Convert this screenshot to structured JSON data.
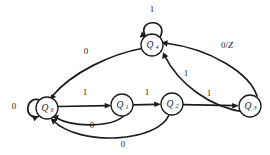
{
  "diagram": {
    "type": "state-transition-diagram",
    "title": "",
    "colors": {
      "stroke": "#1c1c1c",
      "fill": "#ffffff",
      "background": "#ffffff"
    },
    "states": [
      {
        "id": "Q0",
        "label": "Q",
        "subscript": "0",
        "cx": 47,
        "cy": 108,
        "r": 11
      },
      {
        "id": "Q1",
        "label": "Q",
        "subscript": "1",
        "cx": 122,
        "cy": 105,
        "r": 11
      },
      {
        "id": "Q2",
        "label": "Q",
        "subscript": "2",
        "cx": 172,
        "cy": 104,
        "r": 11
      },
      {
        "id": "Q3",
        "label": "Q",
        "subscript": "3",
        "cx": 250,
        "cy": 106,
        "r": 11
      },
      {
        "id": "Q4",
        "label": "Q",
        "subscript": "4",
        "cx": 152,
        "cy": 45,
        "r": 11
      }
    ],
    "transitions": [
      {
        "id": "t-q0-q0",
        "from": "Q0",
        "to": "Q0",
        "label": "0",
        "label_x": 14,
        "label_y": 107,
        "kind": "self-loop"
      },
      {
        "id": "t-q4-q4",
        "from": "Q4",
        "to": "Q4",
        "label": "1",
        "label_x": 152,
        "label_y": 10,
        "kind": "self-loop"
      },
      {
        "id": "t-q0-q1",
        "from": "Q0",
        "to": "Q1",
        "label": "1",
        "label_x": 85,
        "label_y": 93,
        "kind": "straight"
      },
      {
        "id": "t-q1-q2",
        "from": "Q1",
        "to": "Q2",
        "label": "1",
        "label_x": 147,
        "label_y": 93,
        "kind": "straight"
      },
      {
        "id": "t-q2-q3",
        "from": "Q2",
        "to": "Q3",
        "label": "1",
        "label_x": 209,
        "label_y": 94,
        "kind": "straight"
      },
      {
        "id": "t-q1-q0",
        "from": "Q1",
        "to": "Q0",
        "label": "0",
        "label_x": 92,
        "label_y": 126,
        "kind": "curve"
      },
      {
        "id": "t-q2-q0",
        "from": "Q2",
        "to": "Q0",
        "label": "0",
        "label_x": 123,
        "label_y": 145,
        "kind": "curve"
      },
      {
        "id": "t-q4-q0",
        "from": "Q4",
        "to": "Q0",
        "label": "0",
        "label_x": 86,
        "label_y": 52,
        "kind": "curve"
      },
      {
        "id": "t-q2-q4",
        "from": "Q2",
        "to": "Q4",
        "label": "1",
        "label_x": 186,
        "label_y": 74,
        "kind": "curve"
      },
      {
        "id": "t-q3-q4",
        "from": "Q3",
        "to": "Q4",
        "label": "0/Z",
        "label_x": 227,
        "label_y": 46,
        "kind": "curve",
        "italic_part": "Z"
      }
    ],
    "alphabet": [
      "0",
      "1"
    ],
    "output_symbol": "Z"
  }
}
